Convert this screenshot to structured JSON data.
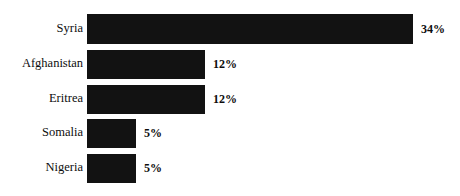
{
  "chart_data": {
    "type": "bar",
    "orientation": "horizontal",
    "title": "",
    "subtitle": "",
    "xlabel": "",
    "ylabel": "",
    "grid": false,
    "legend": null,
    "axis_visible": false,
    "value_suffix": "%",
    "categories": [
      "Syria",
      "Afghanistan",
      "Eritrea",
      "Somalia",
      "Nigeria"
    ],
    "values": [
      34,
      12,
      12,
      5,
      5
    ],
    "value_labels": [
      "34%",
      "12%",
      "12%",
      "5%",
      "5%"
    ],
    "xlim": [
      0,
      34
    ],
    "colors": {
      "bar_fill": "#121212",
      "background": "#ffffff",
      "label_text": "#0d0d0d",
      "value_text": "#0d0d0d"
    },
    "bars": [
      {
        "category": "Syria",
        "value": 34,
        "value_label": "34%",
        "pixel_left": 87,
        "pixel_width": 326,
        "pixel_top": 14,
        "pixel_height": 30,
        "label_center_y": 29,
        "value_label_x": 421
      },
      {
        "category": "Afghanistan",
        "value": 12,
        "value_label": "12%",
        "pixel_left": 87,
        "pixel_width": 118,
        "pixel_top": 50,
        "pixel_height": 29,
        "label_center_y": 64,
        "value_label_x": 213
      },
      {
        "category": "Eritrea",
        "value": 12,
        "value_label": "12%",
        "pixel_left": 87,
        "pixel_width": 118,
        "pixel_top": 85,
        "pixel_height": 29,
        "label_center_y": 99,
        "value_label_x": 213
      },
      {
        "category": "Somalia",
        "value": 5,
        "value_label": "5%",
        "pixel_left": 87,
        "pixel_width": 49,
        "pixel_top": 119,
        "pixel_height": 29,
        "label_center_y": 133,
        "value_label_x": 144
      },
      {
        "category": "Nigeria",
        "value": 5,
        "value_label": "5%",
        "pixel_left": 87,
        "pixel_width": 49,
        "pixel_top": 154,
        "pixel_height": 29,
        "label_center_y": 168,
        "value_label_x": 144
      }
    ]
  }
}
